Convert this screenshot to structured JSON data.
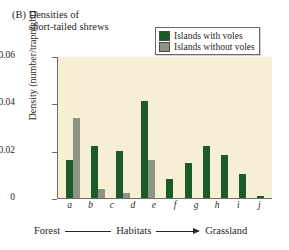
{
  "figure": {
    "panel_label": "(B)",
    "title_line1": "Densities of",
    "title_line2": "short-tailed shrews"
  },
  "legend": {
    "position": "top-right",
    "entries": [
      {
        "label": "Islands with voles",
        "color": "#1b5c26",
        "icon": "square-swatch"
      },
      {
        "label": "Islands without voles",
        "color": "#8d9483",
        "icon": "square-swatch"
      }
    ]
  },
  "axes": {
    "ylabel": "Density (number/trapnight)",
    "yticks": [
      "0",
      "0.02",
      "0.04",
      "0.06"
    ],
    "xlabel_left": "Forest",
    "xlabel_center": "Habitats",
    "xlabel_right": "Grassland"
  },
  "colors": {
    "plot_background": "#f6efd4",
    "axis": "#6f6c64",
    "with_voles": "#1b5c26",
    "without_voles": "#8d9483",
    "text": "#2b2622",
    "page_background": "#ffffff"
  },
  "chart_data": {
    "type": "bar",
    "title": "(B) Densities of short-tailed shrews",
    "xlabel": "Habitats",
    "ylabel": "Density (number/trapnight)",
    "ylim": [
      0,
      0.06
    ],
    "yticks": [
      0,
      0.02,
      0.04,
      0.06
    ],
    "grid": false,
    "legend_position": "top-right",
    "categories": [
      "a",
      "b",
      "c",
      "d",
      "e",
      "f",
      "g",
      "h",
      "i",
      "j"
    ],
    "axis_annotation": "Forest —— Habitats ——▶ Grassland",
    "series": [
      {
        "name": "Islands with voles",
        "color": "#1b5c26",
        "values": [
          0.016,
          0.022,
          0.02,
          0.041,
          0.008,
          0.015,
          0.022,
          0.018,
          0.01,
          0.001
        ]
      },
      {
        "name": "Islands without voles",
        "color": "#8d9483",
        "values": [
          0.034,
          0.004,
          0.002,
          0.016,
          0.0,
          0.0,
          0.0,
          0.0,
          0.0,
          0.0
        ]
      }
    ]
  }
}
